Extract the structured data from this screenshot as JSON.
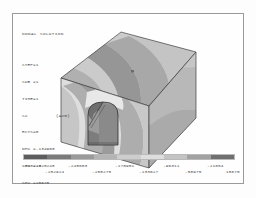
{
  "plot": {
    "title": "NODAL SOLUTION",
    "annotations": [
      {
        "key": "STEP=1",
        "value": ""
      },
      {
        "key": "SUB =1",
        "value": ""
      },
      {
        "key": "TIME=1",
        "value": ""
      },
      {
        "key": "SX",
        "value": "(AVG)"
      },
      {
        "key": "RSYS=0",
        "value": ""
      },
      {
        "key": "DMX =.134960",
        "value": ""
      },
      {
        "key": "SMN =-320248",
        "value": ""
      },
      {
        "key": "SMX =15670",
        "value": ""
      }
    ],
    "result_item": "SX",
    "averaging": "(AVG)",
    "step": "1",
    "sub": "1",
    "time": "1",
    "rsys": "0",
    "dmx": ".134960",
    "smn": "-320248",
    "smx": "15670"
  },
  "legend": {
    "type": "contour-band-colorbar",
    "band_count": 9,
    "colors": [
      "#5d5d5d",
      "#7b7b7b",
      "#9a9a9a",
      "#b4b4b4",
      "#cdcdcd",
      "#dedede",
      "#c3c3c3",
      "#a2a2a2",
      "#6f6f6f"
    ],
    "ticks_upper": [
      "-320248",
      "-245603",
      "-170951",
      "-96311",
      "-21664"
    ],
    "ticks_lower": [
      "-282924",
      "-208278",
      "-133627",
      "-58975",
      "15670"
    ],
    "min": -320248,
    "max": 15670,
    "units": ""
  },
  "model": {
    "description": "rock block with horseshoe tunnel excavation",
    "accent_edge_color": "#3c3c3c",
    "face_top_base": "#cfcfcf",
    "face_front_base": "#e2e2e2",
    "face_right_base": "#b6b6b6",
    "tunnel_interior": "#8f8f8f"
  },
  "chart_data": {
    "type": "heatmap",
    "title": "NODAL SOLUTION",
    "subtitle": "SX (AVG)",
    "xlabel": "",
    "ylabel": "",
    "legend_position": "bottom",
    "grid": false,
    "colorbar_labels_upper": [
      "-320248",
      "-245603",
      "-170951",
      "-96311",
      "-21664"
    ],
    "colorbar_labels_lower": [
      "-282924",
      "-208278",
      "-133627",
      "-58975",
      "15670"
    ],
    "band_edges": [
      -320248,
      -282924,
      -245603,
      -208278,
      -170951,
      -133627,
      -96311,
      -58975,
      -21664,
      15670
    ],
    "values": [
      -320248,
      -282924,
      -245603,
      -208278,
      -170951,
      -133627,
      -96311,
      -58975,
      -21664,
      15670
    ],
    "dmx": 0.13496,
    "smn": -320248,
    "smx": 15670
  }
}
